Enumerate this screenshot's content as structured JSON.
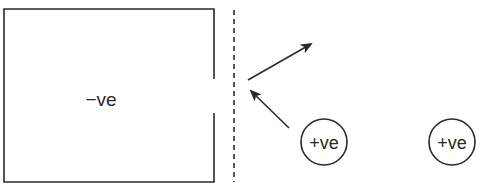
{
  "diagram": {
    "container_label": "−ve",
    "particles": [
      {
        "label": "+ve"
      },
      {
        "label": "+ve"
      }
    ],
    "stroke_color": "#2a2a2a"
  }
}
